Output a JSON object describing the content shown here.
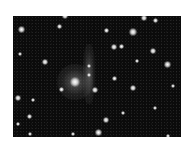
{
  "image": {
    "type": "astronomical-star-field",
    "colors": {
      "background": "#ffffff",
      "sky": "#0b0b0b",
      "stars": "#ffffff"
    }
  },
  "features": {
    "central_galaxy": {
      "x": 62,
      "y": 66,
      "size": 10
    },
    "arc": {
      "x": 76,
      "y": 48,
      "w": 12,
      "h": 60
    },
    "stars": [
      {
        "x": 8,
        "y": 13,
        "s": 7
      },
      {
        "x": 46,
        "y": 10,
        "s": 5
      },
      {
        "x": 52,
        "y": 0,
        "s": 6
      },
      {
        "x": 93,
        "y": 14,
        "s": 5
      },
      {
        "x": 120,
        "y": 16,
        "s": 8
      },
      {
        "x": 131,
        "y": 2,
        "s": 6
      },
      {
        "x": 142,
        "y": 4,
        "s": 5
      },
      {
        "x": 101,
        "y": 31,
        "s": 6
      },
      {
        "x": 108,
        "y": 30,
        "s": 5
      },
      {
        "x": 140,
        "y": 35,
        "s": 6
      },
      {
        "x": 154,
        "y": 48,
        "s": 7
      },
      {
        "x": 124,
        "y": 45,
        "s": 4
      },
      {
        "x": 32,
        "y": 46,
        "s": 6
      },
      {
        "x": 7,
        "y": 38,
        "s": 4
      },
      {
        "x": 76,
        "y": 50,
        "s": 4
      },
      {
        "x": 76,
        "y": 59,
        "s": 4
      },
      {
        "x": 82,
        "y": 74,
        "s": 6
      },
      {
        "x": 101,
        "y": 62,
        "s": 5
      },
      {
        "x": 120,
        "y": 72,
        "s": 6
      },
      {
        "x": 160,
        "y": 70,
        "s": 4
      },
      {
        "x": 48,
        "y": 73,
        "s": 5
      },
      {
        "x": 5,
        "y": 82,
        "s": 6
      },
      {
        "x": 20,
        "y": 84,
        "s": 4
      },
      {
        "x": 16,
        "y": 100,
        "s": 5
      },
      {
        "x": 93,
        "y": 104,
        "s": 6
      },
      {
        "x": 110,
        "y": 97,
        "s": 4
      },
      {
        "x": 5,
        "y": 108,
        "s": 4
      },
      {
        "x": 85,
        "y": 116,
        "s": 7
      },
      {
        "x": 60,
        "y": 118,
        "s": 4
      },
      {
        "x": 142,
        "y": 92,
        "s": 4
      },
      {
        "x": 17,
        "y": 118,
        "s": 4
      },
      {
        "x": 155,
        "y": 120,
        "s": 4
      }
    ]
  }
}
